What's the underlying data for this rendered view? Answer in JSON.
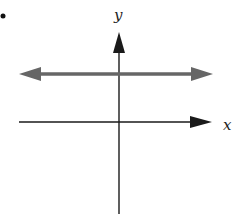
{
  "figure": {
    "bullet": "•",
    "y_axis_label": "y",
    "x_axis_label": "x",
    "colors": {
      "axes": "#1a1a1a",
      "horizontal_line": "#666666",
      "background": "#ffffff"
    }
  }
}
